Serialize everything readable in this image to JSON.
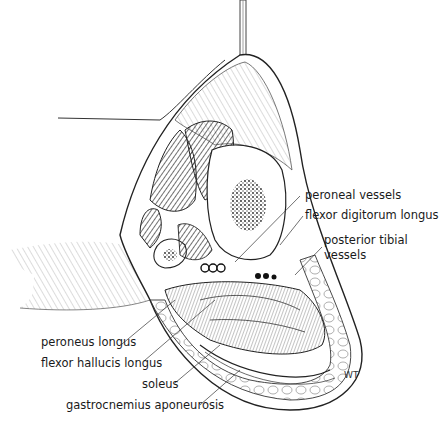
{
  "figure": {
    "signature": "WT",
    "labels": {
      "peroneal_vessels": "peroneal vessels",
      "flexor_digitorum_longus": "flexor digitorum longus",
      "posterior_tibial_vessels_line1": "posterior tibial",
      "posterior_tibial_vessels_line2": "vessels",
      "peroneus_longus": "peroneus longus",
      "flexor_hallucis_longus": "flexor hallucis longus",
      "soleus": "soleus",
      "gastrocnemius_aponeurosis": "gastrocnemius aponeurosis"
    }
  }
}
